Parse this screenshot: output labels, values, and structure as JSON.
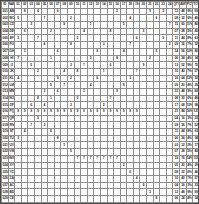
{
  "document": {
    "app": "spreadsheet",
    "view_name": "zoomed-out-worksheet",
    "zoom_level": "25%"
  },
  "colors": {
    "grid_line": "#8d8d8d",
    "sheet_border": "#4a4a4a",
    "header_fill": "#c9c9c9",
    "row_label_fill": "#cfcfcf",
    "summary_fill": "#d4d4d4",
    "footer_fill": "#c4c4c4",
    "band_fill": "#e3e3e3",
    "text": "#2b2b2b",
    "background": "#ffffff"
  },
  "chart_data": {
    "type": "table",
    "title": "",
    "rows": 34,
    "cols": 30,
    "grid": true,
    "col_headers": [
      "ID",
      "NAME",
      "01",
      "02",
      "03",
      "04",
      "05",
      "06",
      "07",
      "08",
      "09",
      "10",
      "11",
      "12",
      "13",
      "14",
      "15",
      "16",
      "17",
      "18",
      "19",
      "20",
      "21",
      "22",
      "23",
      "24",
      "QTY",
      "AMT",
      "PCT",
      "TOT"
    ],
    "row_headers": [
      [
        "001",
        "AB"
      ],
      [
        "002",
        "BC"
      ],
      [
        "003",
        "CD"
      ],
      [
        "004",
        "DE"
      ],
      [
        "005",
        "EF"
      ],
      [
        "006",
        "FG"
      ],
      [
        "007",
        "GH"
      ],
      [
        "008",
        "HI"
      ],
      [
        "009",
        "IJ"
      ],
      [
        "010",
        "JK"
      ],
      [
        "011",
        "KL"
      ],
      [
        "012",
        "LM"
      ],
      [
        "013",
        "MN"
      ],
      [
        "014",
        "NO"
      ],
      [
        "015",
        "OP"
      ],
      [
        "016",
        "PQ"
      ],
      [
        "017",
        "QR"
      ],
      [
        "018",
        "RS"
      ],
      [
        "019",
        "ST"
      ],
      [
        "020",
        "TU"
      ],
      [
        "021",
        "UV"
      ],
      [
        "022",
        "VW"
      ],
      [
        "023",
        "WX"
      ],
      [
        "024",
        "XY"
      ],
      [
        "025",
        "YZ"
      ],
      [
        "026",
        "ZA"
      ],
      [
        "027",
        "AC"
      ],
      [
        "028",
        "BD"
      ],
      [
        "029",
        "CE"
      ],
      [
        "030",
        "DF"
      ],
      [
        "031",
        "EG"
      ],
      [
        "TOT",
        "--"
      ]
    ],
    "body": [
      [
        "",
        "8",
        "",
        "4",
        "",
        "",
        "6",
        "",
        "",
        "",
        "",
        "",
        "",
        "",
        "",
        "2",
        "",
        "",
        "",
        "",
        "9",
        "",
        "3",
        ""
      ],
      [
        "5",
        "",
        "",
        "",
        "7",
        "",
        "",
        "",
        "2",
        "",
        "",
        "",
        "",
        "",
        "",
        "",
        "",
        "4",
        "",
        "",
        "",
        "6",
        "",
        ""
      ],
      [
        "",
        "",
        "3",
        "",
        "",
        "",
        "",
        "9",
        "",
        "",
        "",
        "1",
        "",
        "",
        "",
        "",
        "5",
        "",
        "",
        "",
        "",
        "",
        "",
        "7"
      ],
      [
        "",
        "6",
        "",
        "",
        "",
        "2",
        "",
        "",
        "",
        "",
        "4",
        "",
        "",
        "",
        "8",
        "",
        "",
        "",
        "",
        "3",
        "",
        "",
        "",
        ""
      ],
      [
        "2",
        "",
        "",
        "7",
        "",
        "",
        "",
        "",
        "",
        "5",
        "",
        "",
        "",
        "",
        "",
        "",
        "",
        "",
        "6",
        "",
        "",
        "",
        "9",
        ""
      ],
      [
        "",
        "",
        "",
        "",
        "4",
        "",
        "",
        "",
        "8",
        "",
        "",
        "",
        "",
        "3",
        "",
        "",
        "",
        "7",
        "",
        "",
        "",
        "",
        "",
        "2"
      ],
      [
        "",
        "3",
        "",
        "",
        "",
        "",
        "6",
        "",
        "",
        "",
        "",
        "",
        "9",
        "",
        "",
        "",
        "4",
        "",
        "",
        "",
        "",
        "5",
        "",
        ""
      ],
      [
        "7",
        "",
        "",
        "",
        "",
        "1",
        "",
        "",
        "",
        "",
        "",
        "5",
        "",
        "",
        "",
        "8",
        "",
        "",
        "",
        "",
        "2",
        "",
        "",
        ""
      ],
      [
        "",
        "",
        "5",
        "",
        "",
        "",
        "",
        "",
        "3",
        "",
        "7",
        "",
        "",
        "",
        "6",
        "",
        "",
        "",
        "",
        "9",
        "",
        "",
        "",
        ""
      ],
      [
        "",
        "",
        "",
        "2",
        "",
        "",
        "",
        "4",
        "",
        "8",
        "",
        "",
        "",
        "1",
        "",
        "",
        "",
        "",
        "7",
        "",
        "",
        "",
        "",
        ""
      ],
      [
        "4",
        "",
        "",
        "",
        "",
        "",
        "9",
        "",
        "2",
        "",
        "",
        "",
        "6",
        "",
        "",
        "",
        "",
        "3",
        "",
        "",
        "",
        "",
        "",
        ""
      ],
      [
        "",
        "",
        "",
        "",
        "",
        "5",
        "",
        "7",
        "",
        "",
        "",
        "4",
        "",
        "",
        "",
        "",
        "8",
        "",
        "",
        "",
        "",
        "",
        "",
        ""
      ],
      [
        "",
        "",
        "",
        "",
        "3",
        "",
        "6",
        "",
        "",
        "",
        "2",
        "",
        "",
        "",
        "",
        "9",
        "",
        "",
        "",
        "",
        "",
        "",
        "",
        ""
      ],
      [
        "",
        "",
        "",
        "8",
        "",
        "1",
        "",
        "",
        "",
        "5",
        "",
        "",
        "",
        "",
        "7",
        "",
        "",
        "",
        "",
        "",
        "",
        "",
        "",
        ""
      ],
      [
        "",
        "",
        "6",
        "",
        "4",
        "",
        "",
        "",
        "3",
        "",
        "",
        "",
        "",
        "2",
        "",
        "",
        "",
        "",
        "",
        "",
        "",
        "",
        "",
        ""
      ],
      [
        "9",
        "9",
        "9",
        "9",
        "9",
        "9",
        "9",
        "9",
        "9",
        "9",
        "9",
        "9",
        "9",
        "9",
        "9",
        "9",
        "9",
        "9",
        "9",
        "",
        "",
        "",
        "",
        ""
      ],
      [
        "",
        "",
        "",
        "5",
        "",
        "",
        "",
        "",
        "",
        "",
        "",
        "",
        "",
        "",
        "",
        "",
        "",
        "",
        "",
        "",
        "",
        "",
        "",
        ""
      ],
      [
        "",
        "",
        "7",
        "",
        "2",
        "",
        "",
        "",
        "",
        "",
        "",
        "",
        "",
        "",
        "",
        "",
        "",
        "",
        "",
        "",
        "",
        "",
        "",
        ""
      ],
      [
        "",
        "4",
        "",
        "",
        "",
        "6",
        "",
        "",
        "",
        "",
        "",
        "",
        "",
        "",
        "",
        "",
        "",
        "",
        "",
        "",
        "",
        "",
        "",
        ""
      ],
      [
        "3",
        "",
        "",
        "",
        "",
        "",
        "8",
        "",
        "",
        "",
        "",
        "",
        "",
        "",
        "",
        "",
        "",
        "",
        "",
        "",
        "",
        "",
        "",
        ""
      ],
      [
        "",
        "",
        "",
        "",
        "",
        "",
        "",
        "1",
        "",
        "",
        "",
        "",
        "",
        "",
        "",
        "",
        "",
        "",
        "",
        "",
        "",
        "",
        "",
        ""
      ],
      [
        "",
        "",
        "",
        "",
        "",
        "",
        "",
        "",
        "5",
        "",
        "",
        "",
        "",
        "",
        "",
        "",
        "",
        "",
        "",
        "",
        "",
        "",
        "",
        ""
      ],
      [
        "",
        "",
        "",
        "",
        "",
        "",
        "",
        "",
        "",
        "7",
        "7",
        "7",
        "7",
        "7",
        "7",
        "7",
        "",
        "",
        "",
        "",
        "",
        "",
        "",
        ""
      ],
      [
        "",
        "",
        "",
        "",
        "",
        "",
        "",
        "",
        "",
        "",
        "",
        "",
        "",
        "",
        "",
        "",
        "2",
        "",
        "",
        "",
        "",
        "",
        "",
        ""
      ],
      [
        "",
        "",
        "",
        "",
        "",
        "",
        "",
        "",
        "",
        "",
        "",
        "",
        "",
        "",
        "",
        "",
        "",
        "6",
        "",
        "",
        "",
        "",
        "",
        ""
      ],
      [
        "",
        "",
        "",
        "",
        "",
        "",
        "",
        "",
        "",
        "",
        "",
        "",
        "",
        "",
        "",
        "",
        "",
        "",
        "4",
        "",
        "",
        "",
        "",
        ""
      ],
      [
        "",
        "",
        "",
        "",
        "",
        "",
        "",
        "",
        "",
        "",
        "",
        "",
        "",
        "",
        "",
        "",
        "",
        "",
        "",
        "9",
        "",
        "",
        "",
        ""
      ],
      [
        "",
        "",
        "",
        "",
        "",
        "",
        "",
        "",
        "",
        "",
        "",
        "",
        "",
        "",
        "",
        "",
        "",
        "",
        "",
        "",
        "3",
        "",
        "",
        ""
      ],
      [
        "",
        "",
        "",
        "",
        "",
        "",
        "",
        "",
        "",
        "",
        "",
        "",
        "",
        "",
        "",
        "",
        "",
        "",
        "",
        "",
        "",
        "8",
        "",
        ""
      ],
      [
        "",
        "",
        "",
        "",
        "",
        "",
        "",
        "",
        "",
        "",
        "",
        "",
        "",
        "",
        "",
        "",
        "",
        "",
        "",
        "",
        "",
        "",
        "5",
        ""
      ],
      [
        "",
        "",
        "",
        "",
        "",
        "",
        "",
        "",
        "",
        "",
        "",
        "",
        "",
        "",
        "",
        "",
        "",
        "",
        "",
        "",
        "",
        "",
        "",
        "1"
      ],
      [
        "6",
        "2",
        "8",
        "4",
        "9",
        "3",
        "7",
        "5",
        "1",
        "6",
        "2",
        "8",
        "4",
        "9",
        "3",
        "7",
        "5",
        "1",
        "6",
        "2",
        "8",
        "4",
        "9",
        "3"
      ]
    ],
    "right_summary": [
      [
        "12",
        "48",
        "9%",
        "69"
      ],
      [
        "08",
        "32",
        "6%",
        "46"
      ],
      [
        "15",
        "60",
        "11%",
        "86"
      ],
      [
        "07",
        "28",
        "5%",
        "40"
      ],
      [
        "11",
        "44",
        "8%",
        "63"
      ],
      [
        "09",
        "36",
        "7%",
        "52"
      ],
      [
        "14",
        "56",
        "10%",
        "80"
      ],
      [
        "06",
        "24",
        "4%",
        "34"
      ],
      [
        "13",
        "52",
        "9%",
        "75"
      ],
      [
        "10",
        "40",
        "7%",
        "57"
      ],
      [
        "16",
        "64",
        "12%",
        "92"
      ],
      [
        "05",
        "20",
        "4%",
        "29"
      ],
      [
        "12",
        "48",
        "9%",
        "69"
      ],
      [
        "08",
        "32",
        "6%",
        "46"
      ],
      [
        "17",
        "68",
        "13%",
        "98"
      ],
      [
        "21",
        "84",
        "16%",
        "121"
      ],
      [
        "04",
        "16",
        "3%",
        "23"
      ],
      [
        "09",
        "36",
        "7%",
        "52"
      ],
      [
        "11",
        "44",
        "8%",
        "63"
      ],
      [
        "06",
        "24",
        "4%",
        "34"
      ],
      [
        "03",
        "12",
        "2%",
        "17"
      ],
      [
        "07",
        "28",
        "5%",
        "40"
      ],
      [
        "19",
        "76",
        "14%",
        "109"
      ],
      [
        "05",
        "20",
        "4%",
        "29"
      ],
      [
        "08",
        "32",
        "6%",
        "46"
      ],
      [
        "10",
        "40",
        "7%",
        "57"
      ],
      [
        "04",
        "16",
        "3%",
        "23"
      ],
      [
        "12",
        "48",
        "9%",
        "69"
      ],
      [
        "06",
        "24",
        "4%",
        "34"
      ],
      [
        "09",
        "36",
        "7%",
        "52"
      ],
      [
        "02",
        "08",
        "1%",
        "11"
      ],
      [
        "318",
        "1272",
        "100%",
        "1830"
      ]
    ]
  }
}
